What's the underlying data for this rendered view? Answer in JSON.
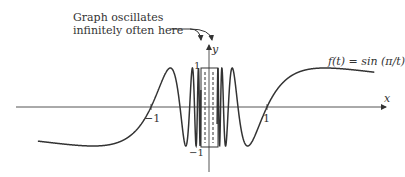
{
  "annotation": {
    "line1": "Graph oscillates",
    "line2": "infinitely often here"
  },
  "axes": {
    "x_label": "x",
    "y_label": "y"
  },
  "ticks": {
    "x_neg": "−1",
    "x_pos": "1",
    "y_pos": "1",
    "y_neg": "−1"
  },
  "function_label": "f(t) = sin (π/t)",
  "colors": {
    "curve": "#333333",
    "axis": "#555555"
  }
}
